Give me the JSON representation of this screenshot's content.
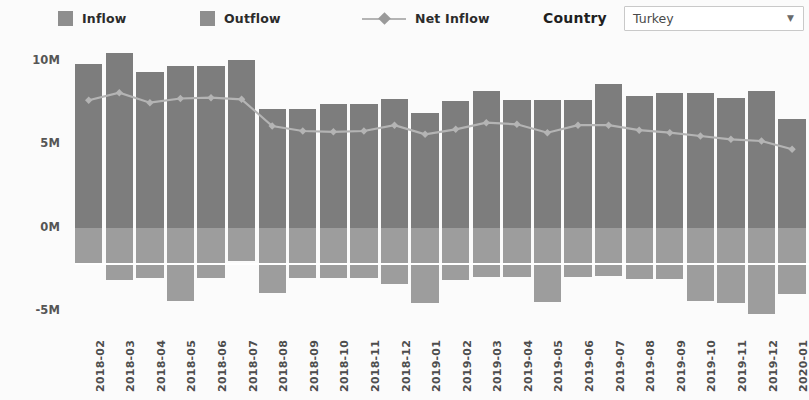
{
  "legend": {
    "inflow": {
      "label": "Inflow",
      "color": "#7d7d7d",
      "icon": "square-swatch-icon"
    },
    "outflow": {
      "label": "Outflow",
      "color": "#9d9d9d",
      "icon": "square-swatch-icon"
    },
    "net_inflow": {
      "label": "Net Inflow",
      "color": "#b4b4b4",
      "icon": "line-marker-icon"
    }
  },
  "controls": {
    "country_label": "Country",
    "country_value": "Turkey",
    "country_placeholder": "Select country",
    "caret_icon": "chevron-down-icon"
  },
  "chart_data": {
    "type": "bar",
    "title": "",
    "xlabel": "",
    "ylabel": "",
    "ylim": [
      -6500000,
      11500000
    ],
    "yticks": [
      10000000,
      5000000,
      0,
      -5000000
    ],
    "ytick_labels": [
      "10M",
      "5M",
      "0M",
      "-5M"
    ],
    "grid": false,
    "legend_position": "top",
    "categories": [
      "2018-02",
      "2018-03",
      "2018-04",
      "2018-05",
      "2018-06",
      "2018-07",
      "2018-08",
      "2018-09",
      "2018-10",
      "2018-11",
      "2018-12",
      "2019-01",
      "2019-02",
      "2019-03",
      "2019-04",
      "2019-05",
      "2019-06",
      "2019-07",
      "2019-08",
      "2019-09",
      "2019-10",
      "2019-11",
      "2019-12",
      "2020-01"
    ],
    "series": [
      {
        "name": "Inflow",
        "type": "bar",
        "color": "#7d7d7d",
        "values": [
          9850000,
          10500000,
          9350000,
          9700000,
          9700000,
          10050000,
          7150000,
          7100000,
          7450000,
          7450000,
          7750000,
          6900000,
          7600000,
          8200000,
          7650000,
          7650000,
          7650000,
          8650000,
          7900000,
          8100000,
          8100000,
          7800000,
          8200000,
          6500000
        ]
      },
      {
        "name": "Outflow",
        "type": "bar",
        "color": "#9d9d9d",
        "values": [
          -2100000,
          -3150000,
          -3050000,
          -4400000,
          -3000000,
          -2000000,
          -3950000,
          -3050000,
          -3050000,
          -3000000,
          -3400000,
          -4550000,
          -3150000,
          -2950000,
          -2950000,
          -4450000,
          -2950000,
          -2900000,
          -3100000,
          -3100000,
          -4400000,
          -4500000,
          -5200000,
          -4000000
        ]
      },
      {
        "name": "Net Inflow",
        "type": "line",
        "color": "#b4b4b4",
        "values": [
          7650000,
          8100000,
          7500000,
          7750000,
          7800000,
          7700000,
          6100000,
          5800000,
          5750000,
          5800000,
          6150000,
          5600000,
          5900000,
          6300000,
          6200000,
          5700000,
          6150000,
          6150000,
          5850000,
          5700000,
          5500000,
          5300000,
          5200000,
          4700000
        ]
      }
    ]
  }
}
